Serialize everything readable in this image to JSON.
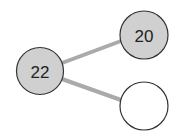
{
  "diagram": {
    "type": "tree",
    "colors": {
      "background": "#ffffff",
      "edge": "#aaaaaa",
      "node_stroke": "#333333",
      "filled_node": "#d0d0d0",
      "empty_node": "#ffffff",
      "text": "#222222"
    },
    "nodes": [
      {
        "id": "root",
        "label": "22",
        "filled": true
      },
      {
        "id": "child-top",
        "label": "20",
        "filled": true
      },
      {
        "id": "child-bottom",
        "label": "",
        "filled": false
      }
    ],
    "edges": [
      {
        "from": "root",
        "to": "child-top"
      },
      {
        "from": "root",
        "to": "child-bottom"
      }
    ]
  }
}
